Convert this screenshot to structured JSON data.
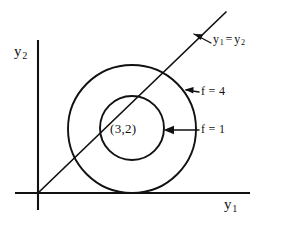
{
  "figure": {
    "background_color": "#ffffff",
    "ink_color": "#111111",
    "axes": {
      "y_axis": {
        "label_base": "y",
        "label_sub": "2",
        "name": "y2"
      },
      "x_axis": {
        "label_base": "y",
        "label_sub": "1",
        "name": "y1"
      },
      "origin": {
        "x": 38,
        "y": 193
      }
    },
    "line": {
      "label_lhs_base": "y",
      "label_lhs_sub": "1",
      "label_eq": "=",
      "label_rhs_base": "y",
      "label_rhs_sub": "2",
      "text": "y1 = y2",
      "from": {
        "x": 38,
        "y": 193
      },
      "to": {
        "x": 226,
        "y": 12
      }
    },
    "contours": [
      {
        "name": "outer-contour",
        "label": "f = 4",
        "value": 4,
        "center": {
          "x": 132,
          "y": 129
        },
        "radius": 64
      },
      {
        "name": "inner-contour",
        "label": "f = 1",
        "value": 1,
        "center": {
          "x": 132,
          "y": 128
        },
        "radius": 32
      }
    ],
    "center_point": {
      "label": "(3,2)",
      "y1": 3,
      "y2": 2
    }
  }
}
